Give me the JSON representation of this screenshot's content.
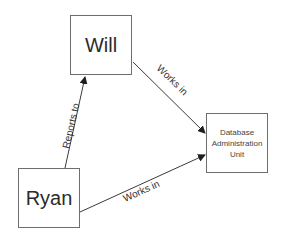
{
  "diagram": {
    "nodes": [
      {
        "id": "will",
        "label": "Will"
      },
      {
        "id": "dbau",
        "label": "Database Administration Unit",
        "lines": [
          "Database",
          "Administration",
          "Unit"
        ]
      },
      {
        "id": "ryan",
        "label": "Ryan"
      }
    ],
    "edges": [
      {
        "from": "ryan",
        "to": "will",
        "label": "Reports to"
      },
      {
        "from": "will",
        "to": "dbau",
        "label": "Works in"
      },
      {
        "from": "ryan",
        "to": "dbau",
        "label": "Works in"
      }
    ],
    "colors": {
      "line": "#3a3a3a",
      "border": "#6e6e6e",
      "text": "#2b2b2b"
    }
  }
}
